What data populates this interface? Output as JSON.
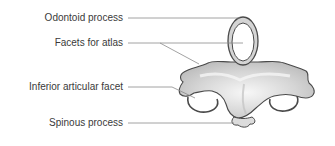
{
  "diagram": {
    "labels": [
      {
        "id": "odontoid",
        "text": "Odontoid process"
      },
      {
        "id": "facets",
        "text": "Facets for atlas"
      },
      {
        "id": "inferior",
        "text": "Inferior articular facet"
      },
      {
        "id": "spinous",
        "text": "Spinous process"
      }
    ],
    "colors": {
      "leader_line": "#8a8a8a",
      "label_text": "#3a3a3a",
      "bone_fill_light": "#f4f4f4",
      "bone_fill_mid": "#cfcfcf",
      "bone_outline": "#4a4a4a",
      "background": "#ffffff"
    }
  }
}
